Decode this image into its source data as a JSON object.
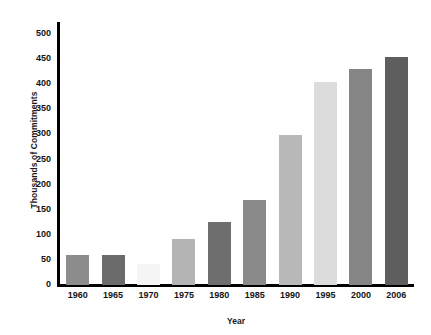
{
  "chart_data": {
    "type": "bar",
    "title": "",
    "xlabel": "Year",
    "ylabel": "Thousands of Commitments",
    "categories": [
      "1960",
      "1965",
      "1970",
      "1975",
      "1980",
      "1985",
      "1990",
      "1995",
      "2000",
      "2006"
    ],
    "values": [
      57,
      57,
      40,
      90,
      123,
      168,
      297,
      402,
      428,
      452
    ],
    "bar_colors": [
      "#8c8c8c",
      "#6b6b6b",
      "#f5f5f5",
      "#b4b4b4",
      "#6e6e6e",
      "#8a8a8a",
      "#b8b8b8",
      "#dcdcdc",
      "#858585",
      "#5e5e5e"
    ],
    "ylim": [
      0,
      500
    ],
    "yticks": [
      "0",
      "50",
      "100",
      "150",
      "200",
      "250",
      "300",
      "350",
      "400",
      "450",
      "500"
    ],
    "ytick_values": [
      0,
      50,
      100,
      150,
      200,
      250,
      300,
      350,
      400,
      450,
      500
    ],
    "grid": false,
    "legend": false,
    "axis_color": "#000000",
    "background": "#ffffff"
  },
  "artifact": {
    "top_fragment": ""
  }
}
